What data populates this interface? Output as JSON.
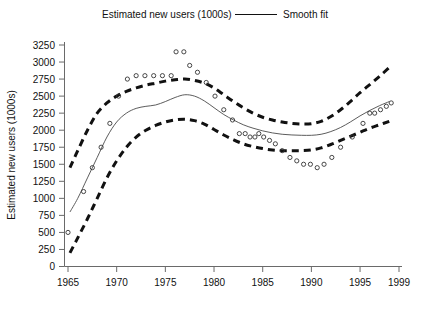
{
  "legend": {
    "series_label": "Estimated new users (1000s)",
    "fit_label": "Smooth fit",
    "rule_icon": "solid-line-icon"
  },
  "axes": {
    "ylabel": "Estimated new users (1000s)",
    "xlabel": "",
    "y_ticks": [
      "0",
      "250",
      "500",
      "750",
      "1000",
      "1250",
      "1500",
      "1750",
      "2000",
      "2250",
      "2500",
      "2750",
      "3000",
      "3250"
    ],
    "x_ticks": [
      "1965",
      "1970",
      "1975",
      "1980",
      "1985",
      "1990",
      "1995",
      "1999"
    ]
  },
  "chart_data": {
    "type": "scatter",
    "title": "Estimated new users (1000s)",
    "xlabel": "",
    "ylabel": "Estimated new users (1000s)",
    "xlim": [
      1964.4,
      1999.0
    ],
    "ylim": [
      0,
      3250
    ],
    "grid": false,
    "legend_position": "top-center",
    "y_tick_values": [
      0,
      250,
      500,
      750,
      1000,
      1250,
      1500,
      1750,
      2000,
      2250,
      2500,
      2750,
      3000,
      3250
    ],
    "x_tick_values": [
      1965,
      1970,
      1975,
      1980,
      1985,
      1990,
      1995,
      1999
    ],
    "series": [
      {
        "name": "Estimated new users (1000s)",
        "marker": "open-circle",
        "x": [
          1965.0,
          1966.6,
          1967.5,
          1968.4,
          1969.3,
          1970.2,
          1971.1,
          1972.0,
          1972.9,
          1973.8,
          1974.7,
          1975.6,
          1976.1,
          1976.9,
          1977.5,
          1978.3,
          1979.2,
          1980.1,
          1981.0,
          1981.9,
          1982.6,
          1983.2,
          1983.7,
          1984.2,
          1984.6,
          1985.1,
          1985.7,
          1986.3,
          1987.0,
          1987.8,
          1988.5,
          1989.2,
          1989.9,
          1990.6,
          1991.3,
          1992.1,
          1993.0,
          1994.2,
          1995.3,
          1996.0,
          1996.5,
          1997.1,
          1997.7,
          1998.2
        ],
        "y": [
          500,
          1100,
          1450,
          1750,
          2100,
          2500,
          2750,
          2800,
          2800,
          2800,
          2800,
          2800,
          3150,
          3150,
          2950,
          2850,
          2700,
          2500,
          2300,
          2150,
          1950,
          1950,
          1900,
          1900,
          1950,
          1900,
          1850,
          1800,
          1700,
          1600,
          1550,
          1500,
          1500,
          1450,
          1500,
          1600,
          1750,
          1900,
          2100,
          2250,
          2250,
          2300,
          2350,
          2400
        ]
      },
      {
        "name": "Smooth fit",
        "type": "line",
        "style": "solid",
        "x": [
          1965.2,
          1966,
          1967,
          1968,
          1969,
          1970,
          1971,
          1972,
          1973,
          1974,
          1975,
          1976,
          1977,
          1978,
          1979,
          1980,
          1981,
          1982,
          1983,
          1984,
          1985,
          1986,
          1987,
          1988,
          1989,
          1990,
          1991,
          1992,
          1993,
          1994,
          1995,
          1996,
          1997,
          1998
        ],
        "y": [
          800,
          1000,
          1300,
          1600,
          1900,
          2120,
          2250,
          2320,
          2350,
          2370,
          2420,
          2480,
          2520,
          2500,
          2430,
          2330,
          2230,
          2150,
          2080,
          2030,
          1990,
          1960,
          1940,
          1930,
          1925,
          1925,
          1940,
          1980,
          2040,
          2120,
          2210,
          2290,
          2360,
          2420
        ]
      },
      {
        "name": "Upper confidence band",
        "type": "line",
        "style": "dashed",
        "x": [
          1965.2,
          1966,
          1967,
          1968,
          1969,
          1970,
          1971,
          1972,
          1973,
          1974,
          1975,
          1976,
          1977,
          1978,
          1979,
          1980,
          1981,
          1982,
          1983,
          1984,
          1985,
          1986,
          1987,
          1988,
          1989,
          1990,
          1991,
          1992,
          1993,
          1994,
          1995,
          1996,
          1997,
          1998
        ],
        "y": [
          1450,
          1700,
          2000,
          2250,
          2400,
          2500,
          2570,
          2620,
          2660,
          2690,
          2720,
          2740,
          2750,
          2730,
          2690,
          2620,
          2520,
          2420,
          2330,
          2250,
          2190,
          2150,
          2120,
          2100,
          2090,
          2095,
          2130,
          2200,
          2300,
          2420,
          2550,
          2670,
          2790,
          2920
        ]
      },
      {
        "name": "Lower confidence band",
        "type": "line",
        "style": "dashed",
        "x": [
          1965.2,
          1966,
          1967,
          1968,
          1969,
          1970,
          1971,
          1972,
          1973,
          1974,
          1975,
          1976,
          1977,
          1978,
          1979,
          1980,
          1981,
          1982,
          1983,
          1984,
          1985,
          1986,
          1987,
          1988,
          1989,
          1990,
          1991,
          1992,
          1993,
          1994,
          1995,
          1996,
          1997,
          1998
        ],
        "y": [
          200,
          420,
          700,
          1000,
          1300,
          1550,
          1750,
          1900,
          2000,
          2070,
          2120,
          2150,
          2160,
          2140,
          2090,
          2010,
          1930,
          1860,
          1800,
          1760,
          1730,
          1710,
          1700,
          1700,
          1700,
          1710,
          1740,
          1790,
          1850,
          1910,
          1970,
          2030,
          2080,
          2130
        ]
      }
    ]
  }
}
